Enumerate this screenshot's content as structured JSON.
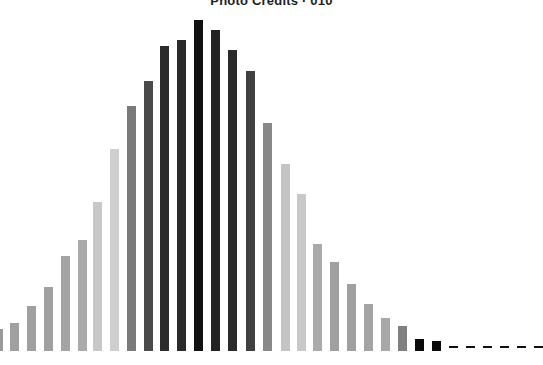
{
  "chart_data": {
    "type": "bar",
    "title": "Photo Credits · 010",
    "xlabel": "",
    "ylabel": "",
    "grid": false,
    "legend": null,
    "axes_visible": false,
    "baseline_px": 351,
    "bar_width_px": 9,
    "ylim": [
      0,
      340
    ],
    "categories": [
      "1",
      "2",
      "3",
      "4",
      "5",
      "6",
      "7",
      "8",
      "9",
      "10",
      "11",
      "12",
      "13",
      "14",
      "15",
      "16",
      "17",
      "18",
      "19",
      "20",
      "21",
      "22",
      "23",
      "24",
      "25",
      "26",
      "27",
      "28",
      "29",
      "30",
      "31",
      "32",
      "33"
    ],
    "x_px": [
      0,
      10,
      27,
      44,
      61,
      78,
      93,
      110,
      127,
      144,
      160,
      177,
      194,
      211,
      228,
      246,
      263,
      281,
      297,
      313,
      330,
      347,
      364,
      381,
      398,
      415,
      432,
      449,
      466,
      483,
      500,
      517,
      534
    ],
    "widths_px": [
      3,
      9,
      9,
      9,
      9,
      9,
      9,
      9,
      9,
      9,
      9,
      9,
      9,
      9,
      9,
      9,
      9,
      9,
      9,
      9,
      9,
      9,
      9,
      9,
      9,
      9,
      9,
      9,
      9,
      9,
      9,
      9,
      9
    ],
    "values": [
      22,
      28,
      45,
      64,
      95,
      111,
      149,
      202,
      245,
      270,
      305,
      311,
      331,
      321,
      301,
      280,
      228,
      187,
      157,
      107,
      89,
      67,
      47,
      33,
      25,
      12,
      10,
      2,
      2,
      2,
      2,
      2,
      2
    ],
    "colors": [
      "#999999",
      "#a0a0a0",
      "#a0a0a0",
      "#a0a0a0",
      "#a4a4a4",
      "#aaaaaa",
      "#c8c8c8",
      "#cfcfcf",
      "#7a7a7a",
      "#4a4a4a",
      "#2c2c2c",
      "#2a2a2a",
      "#111111",
      "#222222",
      "#2a2a2a",
      "#404040",
      "#888888",
      "#c4c4c4",
      "#c8c8c8",
      "#aaaaaa",
      "#a0a0a0",
      "#a0a0a0",
      "#a4a4a4",
      "#a8a8a8",
      "#808080",
      "#0a0a0a",
      "#0a0a0a",
      "#111111",
      "#111111",
      "#111111",
      "#111111",
      "#111111",
      "#111111"
    ]
  }
}
